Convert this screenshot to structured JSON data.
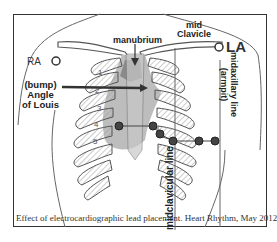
{
  "diagram": {
    "type": "anatomical-illustration",
    "labels": {
      "ra": "RA",
      "la": "LA",
      "manubrium": "manubrium",
      "mid_clavicle_line1": "mid",
      "mid_clavicle_line2": "Clavicle",
      "bump_line1": "(bump)",
      "bump_line2": "Angle",
      "bump_line3": "of Louis",
      "axillary_line1": "midaxillary line",
      "axillary_line2": "(armpit)",
      "midclavicular": "midclavicular line"
    },
    "intercostal_numbers": [
      "1",
      "2",
      "3",
      "4",
      "5"
    ],
    "electrodes": [
      {
        "id": "V1",
        "x": 119,
        "y": 126
      },
      {
        "id": "V2",
        "x": 153,
        "y": 126
      },
      {
        "id": "V3",
        "x": 160,
        "y": 134
      },
      {
        "id": "V4",
        "x": 173,
        "y": 141
      },
      {
        "id": "V5",
        "x": 199,
        "y": 141
      },
      {
        "id": "V6",
        "x": 215,
        "y": 141
      }
    ],
    "colors": {
      "outline": "#555555",
      "heart_shade": "#b8b8b8",
      "heart_dark": "#8a8a8a",
      "electrode_fill": "#333333",
      "frame": "#333333"
    },
    "caption": "Effect of electrocardiographic lead placement. Heart Rhythm, May 2012"
  }
}
